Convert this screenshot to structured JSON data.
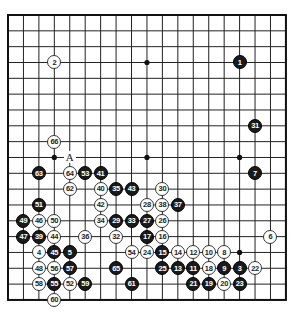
{
  "board": {
    "size": 19,
    "origin_x": 8,
    "origin_y": 15,
    "spacing_x": 15.44,
    "spacing_y": 15.83,
    "line_color": "#222222",
    "border_color": "#111111",
    "star_points": [
      [
        3,
        3
      ],
      [
        9,
        3
      ],
      [
        15,
        3
      ],
      [
        3,
        9
      ],
      [
        9,
        9
      ],
      [
        15,
        9
      ],
      [
        3,
        15
      ],
      [
        9,
        15
      ],
      [
        15,
        15
      ]
    ]
  },
  "stones": [
    {
      "n": "1",
      "color": "black",
      "c": 15,
      "r": 3
    },
    {
      "n": "2",
      "color": "white",
      "c": 3,
      "r": 3
    },
    {
      "n": "3",
      "color": "black",
      "c": 15,
      "r": 16
    },
    {
      "n": "4",
      "color": "white",
      "c": 2,
      "r": 15
    },
    {
      "n": "5",
      "color": "black",
      "c": 4,
      "r": 15
    },
    {
      "n": "6",
      "color": "white",
      "c": 17,
      "r": 14
    },
    {
      "n": "7",
      "color": "black",
      "c": 16,
      "r": 10
    },
    {
      "n": "8",
      "color": "white",
      "c": 14,
      "r": 15
    },
    {
      "n": "9",
      "color": "black",
      "c": 14,
      "r": 16
    },
    {
      "n": "10",
      "color": "white",
      "c": 13,
      "r": 15
    },
    {
      "n": "11",
      "color": "black",
      "c": 12,
      "r": 16
    },
    {
      "n": "12",
      "color": "white",
      "c": 12,
      "r": 15
    },
    {
      "n": "13",
      "color": "black",
      "c": 11,
      "r": 16
    },
    {
      "n": "14",
      "color": "white",
      "c": 11,
      "r": 15
    },
    {
      "n": "15",
      "color": "black",
      "c": 10,
      "r": 15
    },
    {
      "n": "16",
      "color": "white",
      "c": 10,
      "r": 14
    },
    {
      "n": "17",
      "color": "black",
      "c": 9,
      "r": 14
    },
    {
      "n": "18",
      "color": "white",
      "c": 13,
      "r": 16
    },
    {
      "n": "19",
      "color": "black",
      "c": 13,
      "r": 17
    },
    {
      "n": "20",
      "color": "white",
      "c": 14,
      "r": 17
    },
    {
      "n": "21",
      "color": "black",
      "c": 12,
      "r": 17
    },
    {
      "n": "22",
      "color": "white",
      "c": 16,
      "r": 16
    },
    {
      "n": "23",
      "color": "black",
      "c": 15,
      "r": 17
    },
    {
      "n": "24",
      "color": "white",
      "c": 9,
      "r": 15
    },
    {
      "n": "25",
      "color": "black",
      "c": 10,
      "r": 16
    },
    {
      "n": "26",
      "color": "white",
      "c": 10,
      "r": 13
    },
    {
      "n": "27",
      "color": "black",
      "c": 9,
      "r": 13
    },
    {
      "n": "28",
      "color": "white",
      "c": 9,
      "r": 12
    },
    {
      "n": "29",
      "color": "black",
      "c": 7,
      "r": 13
    },
    {
      "n": "30",
      "color": "white",
      "c": 10,
      "r": 11
    },
    {
      "n": "31",
      "color": "black",
      "c": 16,
      "r": 7
    },
    {
      "n": "32",
      "color": "white",
      "c": 7,
      "r": 14
    },
    {
      "n": "33",
      "color": "black",
      "c": 8,
      "r": 13
    },
    {
      "n": "34",
      "color": "white",
      "c": 6,
      "r": 13
    },
    {
      "n": "35",
      "color": "black",
      "c": 7,
      "r": 11
    },
    {
      "n": "36",
      "color": "white",
      "c": 5,
      "r": 14
    },
    {
      "n": "37",
      "color": "black",
      "c": 11,
      "r": 12
    },
    {
      "n": "38",
      "color": "white",
      "c": 10,
      "r": 12
    },
    {
      "n": "39",
      "color": "black",
      "c": 2,
      "r": 14
    },
    {
      "n": "40",
      "color": "white",
      "c": 6,
      "r": 11
    },
    {
      "n": "41",
      "color": "black",
      "c": 6,
      "r": 10
    },
    {
      "n": "42",
      "color": "white",
      "c": 6,
      "r": 12
    },
    {
      "n": "43",
      "color": "black",
      "c": 8,
      "r": 11
    },
    {
      "n": "44",
      "color": "white",
      "c": 3,
      "r": 14
    },
    {
      "n": "45",
      "color": "black",
      "c": 3,
      "r": 15
    },
    {
      "n": "46",
      "color": "white",
      "c": 2,
      "r": 13
    },
    {
      "n": "47",
      "color": "black",
      "c": 1,
      "r": 14
    },
    {
      "n": "48",
      "color": "white",
      "c": 2,
      "r": 16
    },
    {
      "n": "49",
      "color": "black",
      "c": 1,
      "r": 13
    },
    {
      "n": "50",
      "color": "white",
      "c": 3,
      "r": 13
    },
    {
      "n": "51",
      "color": "black",
      "c": 2,
      "r": 12
    },
    {
      "n": "52",
      "color": "white",
      "c": 4,
      "r": 17
    },
    {
      "n": "53",
      "color": "black",
      "c": 5,
      "r": 10
    },
    {
      "n": "54",
      "color": "white",
      "c": 8,
      "r": 15
    },
    {
      "n": "55",
      "color": "black",
      "c": 3,
      "r": 17
    },
    {
      "n": "56",
      "color": "white",
      "c": 3,
      "r": 16
    },
    {
      "n": "57",
      "color": "black",
      "c": 4,
      "r": 16
    },
    {
      "n": "58",
      "color": "white",
      "c": 2,
      "r": 17
    },
    {
      "n": "59",
      "color": "black",
      "c": 5,
      "r": 17
    },
    {
      "n": "60",
      "color": "white",
      "c": 3,
      "r": 18
    },
    {
      "n": "61",
      "color": "black",
      "c": 8,
      "r": 17
    },
    {
      "n": "62",
      "color": "white",
      "c": 4,
      "r": 11
    },
    {
      "n": "63",
      "color": "black",
      "c": 2,
      "r": 10
    },
    {
      "n": "64",
      "color": "white",
      "c": 4,
      "r": 10
    },
    {
      "n": "65",
      "color": "black",
      "c": 7,
      "r": 16
    },
    {
      "n": "66",
      "color": "white",
      "c": 3,
      "r": 8
    }
  ],
  "labels": [
    {
      "text": "A",
      "c": 4,
      "r": 9
    }
  ]
}
